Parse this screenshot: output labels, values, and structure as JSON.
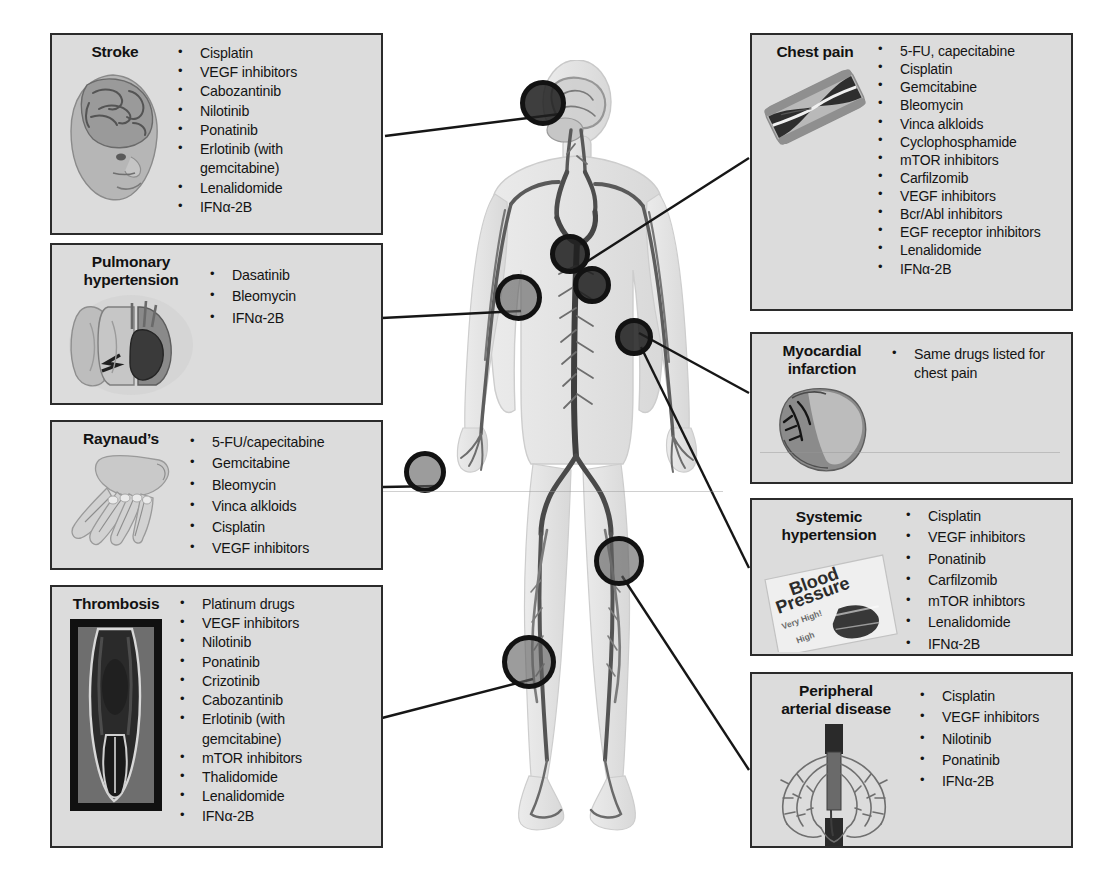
{
  "figure": {
    "markers": [
      {
        "name": "marker-brain",
        "site": "brain",
        "x": 543,
        "y": 103,
        "size": 46,
        "style": "dark"
      },
      {
        "name": "marker-heart-great-vessels",
        "site": "heart-great-vessels",
        "x": 570,
        "y": 254,
        "size": 40,
        "style": "dark"
      },
      {
        "name": "marker-heart",
        "site": "heart",
        "x": 592,
        "y": 285,
        "size": 38,
        "style": "dark"
      },
      {
        "name": "marker-lung",
        "site": "lung",
        "x": 518,
        "y": 297,
        "size": 47,
        "style": "light"
      },
      {
        "name": "marker-upper-arm-artery",
        "site": "upper-arm-artery",
        "x": 634,
        "y": 337,
        "size": 38,
        "style": "dark"
      },
      {
        "name": "marker-hand",
        "site": "hand",
        "x": 425,
        "y": 472,
        "size": 42,
        "style": "light"
      },
      {
        "name": "marker-thigh-artery",
        "site": "thigh-artery",
        "x": 619,
        "y": 561,
        "size": 50,
        "style": "light"
      },
      {
        "name": "marker-lower-leg-vein",
        "site": "lower-leg-vein",
        "x": 529,
        "y": 662,
        "size": 54,
        "style": "light"
      }
    ],
    "connectors": [
      {
        "name": "connector-stroke",
        "x1": 385,
        "y1": 136,
        "x2": 560,
        "y2": 114
      },
      {
        "name": "connector-pulmonary-hypertension",
        "x1": 382,
        "y1": 318,
        "x2": 521,
        "y2": 311
      },
      {
        "name": "connector-raynauds",
        "x1": 383,
        "y1": 487,
        "x2": 438,
        "y2": 486
      },
      {
        "name": "connector-thrombosis",
        "x1": 382,
        "y1": 718,
        "x2": 533,
        "y2": 679
      },
      {
        "name": "connector-chest-pain",
        "x1": 749,
        "y1": 158,
        "x2": 577,
        "y2": 268
      },
      {
        "name": "connector-myocardial-infarction",
        "x1": 749,
        "y1": 393,
        "x2": 639,
        "y2": 333
      },
      {
        "name": "connector-systemic-hypertension",
        "x1": 749,
        "y1": 568,
        "x2": 641,
        "y2": 347
      },
      {
        "name": "connector-peripheral-arterial-disease",
        "x1": 749,
        "y1": 770,
        "x2": 622,
        "y2": 576
      }
    ]
  },
  "boxes": [
    {
      "id": "stroke",
      "name": "stroke-box",
      "title": "Stroke",
      "thumb_name": "head-brain-illustration-icon",
      "thumb": "head-brain",
      "drugs": [
        "Cisplatin",
        "VEGF inhibitors",
        "Cabozantinib",
        "Nilotinib",
        "Ponatinib",
        "Erlotinib (with\ngemcitabine)",
        "Lenalidomide",
        "IFNα-2B"
      ]
    },
    {
      "id": "pulmonary-hypertension",
      "name": "pulmonary-hypertension-box",
      "title": "Pulmonary\nhypertension",
      "thumb_name": "lungs-heart-illustration-icon",
      "thumb": "lungs-heart",
      "drugs": [
        "Dasatinib",
        "Bleomycin",
        "IFNα-2B"
      ]
    },
    {
      "id": "raynauds",
      "name": "raynauds-box",
      "title": "Raynaud’s",
      "thumb_name": "hand-illustration-icon",
      "thumb": "hand",
      "drugs": [
        "5-FU/capecitabine",
        "Gemcitabine",
        "Bleomycin",
        "Vinca alkloids",
        "Cisplatin",
        "VEGF inhibitors"
      ]
    },
    {
      "id": "thrombosis",
      "name": "thrombosis-box",
      "title": "Thrombosis",
      "thumb_name": "thrombosed-vein-photo-icon",
      "thumb": "vein-photo",
      "drugs": [
        "Platinum drugs",
        "VEGF inhibitors",
        "Nilotinib",
        "Ponatinib",
        "Crizotinib",
        "Cabozantinib",
        "Erlotinib (with\ngemcitabine)",
        "mTOR inhibitors",
        "Thalidomide",
        "Lenalidomide",
        "IFNα-2B"
      ]
    },
    {
      "id": "chest-pain",
      "name": "chest-pain-box",
      "title": "Chest pain",
      "thumb_name": "narrowed-artery-illustration-icon",
      "thumb": "artery-plaque",
      "drugs": [
        "5-FU, capecitabine",
        "Cisplatin",
        "Gemcitabine",
        "Bleomycin",
        "Vinca alkloids",
        "Cyclophosphamide",
        "mTOR inhibitors",
        "Carfilzomib",
        "VEGF inhibitors",
        "Bcr/Abl inhibitors",
        "EGF receptor inhibitors",
        "Lenalidomide",
        "IFNα-2B"
      ]
    },
    {
      "id": "myocardial-infarction",
      "name": "myocardial-infarction-box",
      "title": "Myocardial\ninfarction",
      "thumb_name": "heart-photo-icon",
      "thumb": "heart-photo",
      "drugs": [
        "Same drugs listed for\nchest pain"
      ]
    },
    {
      "id": "systemic-hypertension",
      "name": "systemic-hypertension-box",
      "title": "Systemic\nhypertension",
      "thumb_name": "blood-pressure-gauge-icon",
      "thumb": "blood-pressure",
      "thumb_labels": {
        "line1": "Blood",
        "line2": "Pressure",
        "tick_high": "Very High!",
        "tick_mid": "High"
      },
      "drugs": [
        "Cisplatin",
        "VEGF inhibitors",
        "Ponatinib",
        "Carfilzomib",
        "mTOR inhibtors",
        "Lenalidomide",
        "IFNα-2B"
      ]
    },
    {
      "id": "peripheral-arterial-disease",
      "name": "peripheral-arterial-disease-box",
      "title": "Peripheral\narterial disease",
      "thumb_name": "angiogram-arteries-illustration-icon",
      "thumb": "angiogram",
      "drugs": [
        "Cisplatin",
        "VEGF inhibitors",
        "Nilotinib",
        "Ponatinib",
        "IFNα-2B"
      ]
    }
  ],
  "colors": {
    "box_border": "#2b2b2b",
    "box_fill": "#dcdcdc",
    "text": "#141414",
    "marker_ring": "#121212",
    "marker_fill_light": "#5f5f5f",
    "marker_fill_dark": "#1e1e1e",
    "connector": "#161616",
    "background": "#ffffff"
  }
}
